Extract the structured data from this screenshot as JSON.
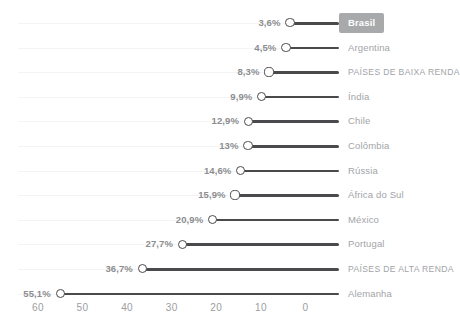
{
  "chart_data": {
    "type": "bar",
    "orientation": "horizontal",
    "title": "",
    "subtitle": "",
    "xlabel": "",
    "ylabel": "",
    "xlim": [
      60,
      0
    ],
    "x_axis_reversed": true,
    "grid": true,
    "legend": false,
    "value_suffix": "%",
    "decimal_separator": ",",
    "xticks": [
      60,
      50,
      40,
      30,
      20,
      10,
      0
    ],
    "xtick_labels": [
      "60",
      "50",
      "40",
      "30",
      "20",
      "10",
      "0"
    ],
    "categories": [
      "Brasil",
      "Argentina",
      "PAÍSES DE BAIXA RENDA",
      "Índia",
      "Chile",
      "Colômbia",
      "Rússia",
      "África do Sul",
      "México",
      "Portugal",
      "PAÍSES DE ALTA RENDA",
      "Alemanha"
    ],
    "values": [
      3.6,
      4.5,
      8.3,
      9.9,
      12.9,
      13,
      14.6,
      15.9,
      20.9,
      27.7,
      36.7,
      55.1
    ],
    "value_labels": [
      "3,6%",
      "4,5%",
      "8,3%",
      "9,9%",
      "12,9%",
      "13%",
      "14,6%",
      "15,9%",
      "20,9%",
      "27,7%",
      "36,7%",
      "55,1%"
    ],
    "highlighted_category": "Brasil",
    "uppercase_categories": [
      "PAÍSES DE BAIXA RENDA",
      "PAÍSES DE ALTA RENDA"
    ],
    "colors": {
      "bar": "#4a4a4c",
      "dot_fill": "#ffffff",
      "dot_stroke": "#4a4a4c",
      "value_label": "#8b8d90",
      "category_label": "#a2a4a7",
      "highlight_background": "#a8a9ab",
      "highlight_text": "#ffffff",
      "gridline": "#f4f4f5",
      "axis_tick": "#9b9da0",
      "background": "#ffffff"
    }
  }
}
